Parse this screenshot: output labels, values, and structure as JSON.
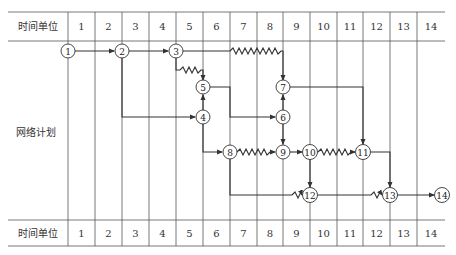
{
  "header": {
    "label": "时间单位",
    "units": [
      "1",
      "2",
      "3",
      "4",
      "5",
      "6",
      "7",
      "8",
      "9",
      "10",
      "11",
      "12",
      "13",
      "14"
    ]
  },
  "footer": {
    "label": "时间单位",
    "units": [
      "1",
      "2",
      "3",
      "4",
      "5",
      "6",
      "7",
      "8",
      "9",
      "10",
      "11",
      "12",
      "13",
      "14"
    ]
  },
  "side_label": "网络计划",
  "nodes": [
    {
      "id": "1",
      "x": 68,
      "y": 51
    },
    {
      "id": "2",
      "x": 122,
      "y": 51
    },
    {
      "id": "3",
      "x": 176,
      "y": 51
    },
    {
      "id": "4",
      "x": 203,
      "y": 117
    },
    {
      "id": "5",
      "x": 203,
      "y": 87
    },
    {
      "id": "6",
      "x": 283,
      "y": 117
    },
    {
      "id": "7",
      "x": 283,
      "y": 87
    },
    {
      "id": "8",
      "x": 230,
      "y": 152
    },
    {
      "id": "9",
      "x": 283,
      "y": 152
    },
    {
      "id": "10",
      "x": 310,
      "y": 152
    },
    {
      "id": "11",
      "x": 363,
      "y": 152
    },
    {
      "id": "12",
      "x": 310,
      "y": 195
    },
    {
      "id": "13",
      "x": 390,
      "y": 195
    },
    {
      "id": "14",
      "x": 442,
      "y": 195
    }
  ],
  "edges": [
    {
      "from": "1",
      "to": "2",
      "type": "solid"
    },
    {
      "from": "2",
      "to": "3",
      "type": "solid"
    },
    {
      "from": "2",
      "to": "4",
      "type": "solid"
    },
    {
      "from": "3",
      "to": "5",
      "type": "free-float"
    },
    {
      "from": "3",
      "to": "7",
      "type": "free-float"
    },
    {
      "from": "4",
      "to": "5",
      "type": "solid"
    },
    {
      "from": "4",
      "to": "8",
      "type": "solid"
    },
    {
      "from": "5",
      "to": "6",
      "type": "solid"
    },
    {
      "from": "6",
      "to": "7",
      "type": "solid"
    },
    {
      "from": "6",
      "to": "9",
      "type": "solid"
    },
    {
      "from": "7",
      "to": "11",
      "type": "solid"
    },
    {
      "from": "8",
      "to": "9",
      "type": "free-float"
    },
    {
      "from": "8",
      "to": "12",
      "type": "free-float"
    },
    {
      "from": "9",
      "to": "10",
      "type": "solid"
    },
    {
      "from": "10",
      "to": "11",
      "type": "free-float"
    },
    {
      "from": "10",
      "to": "12",
      "type": "solid"
    },
    {
      "from": "11",
      "to": "13",
      "type": "solid"
    },
    {
      "from": "12",
      "to": "13",
      "type": "free-float"
    },
    {
      "from": "13",
      "to": "14",
      "type": "solid"
    }
  ],
  "colors": {
    "line": "#333333",
    "grid": "#555555",
    "node_fill": "#ffffff"
  }
}
